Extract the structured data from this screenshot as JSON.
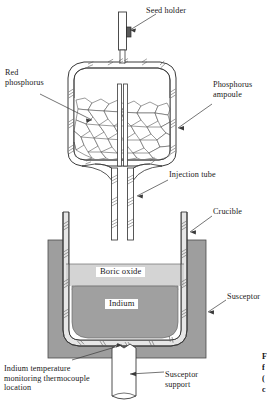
{
  "figure": {
    "background_color": "#ffffff",
    "line_color": "#3a3a3a"
  },
  "labels": {
    "seed_holder": "Seed holder",
    "red_phosphorus": "Red\nphosphorus",
    "phosphorus_ampoule": "Phosphorus\nampoule",
    "injection_tube": "Injection tube",
    "crucible": "Crucible",
    "susceptor": "Susceptor",
    "boric_oxide": "Boric oxide",
    "indium": "Indium",
    "thermocouple": "Indium temperature\nmonitoring thermocouple\nlocation",
    "susceptor_support": "Susceptor\nsupport"
  },
  "caption_fragment": {
    "line1": "F",
    "line2": "f",
    "line3": "(",
    "line4": "c"
  },
  "materials": {
    "susceptor_fill": "#9e9e9e",
    "indium_fill": "#a0a0a0",
    "boric_oxide_fill": "#d4d4d4",
    "crucible_fill": "#ffffff",
    "support_fill": "#ffffff",
    "ampoule_fill": "#ffffff",
    "granule_fill": "#ffffff",
    "stroke": "#3a3a3a",
    "seed_fill": "#4a4a4a"
  },
  "components": [
    {
      "name": "seed-holder-rod",
      "type": "rod"
    },
    {
      "name": "seed-crystal",
      "type": "block"
    },
    {
      "name": "phosphorus-ampoule",
      "type": "vessel"
    },
    {
      "name": "red-phosphorus-granules",
      "type": "fill"
    },
    {
      "name": "injection-tube",
      "type": "tube"
    },
    {
      "name": "crucible",
      "type": "vessel"
    },
    {
      "name": "boric-oxide-layer",
      "type": "layer"
    },
    {
      "name": "indium-melt",
      "type": "layer"
    },
    {
      "name": "susceptor",
      "type": "block"
    },
    {
      "name": "susceptor-support",
      "type": "tube"
    },
    {
      "name": "thermocouple-location",
      "type": "point"
    }
  ]
}
